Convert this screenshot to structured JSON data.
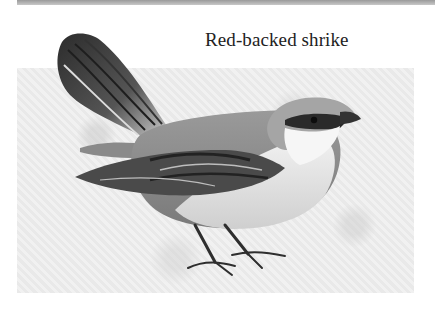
{
  "caption": "Red-backed shrike",
  "illustration": {
    "subject": "bird-illustration",
    "colors": {
      "background_panel": "#ececec",
      "top_band": "#a8a8a8",
      "caption_text": "#222222"
    }
  }
}
